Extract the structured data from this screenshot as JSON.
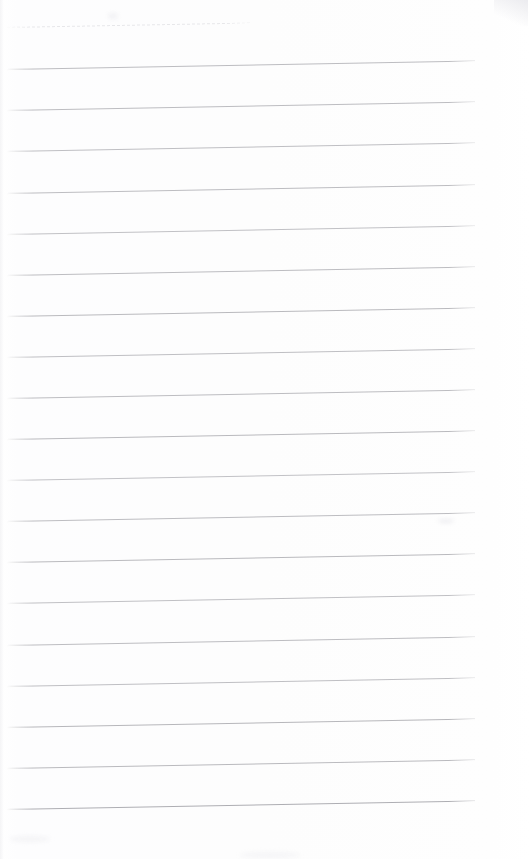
{
  "document": {
    "kind": "scanned-ruled-paper",
    "page_label": "",
    "written_text": "",
    "background_color": "#fdfdfd",
    "rule_color": "#b9b9bd",
    "rule_color_faint": "#cfcfd4",
    "rule_color_dark": "#aeaeb3",
    "page_width": 530,
    "page_height": 859,
    "rule_count": 20,
    "rule_spacing": 40,
    "skew_degrees": -1.05,
    "margin": {
      "left": 7,
      "right": 55,
      "top": 27,
      "bottom": 47
    },
    "rules": [
      {
        "name": "guide-line-dashed",
        "y": 27,
        "x": 7,
        "width": 243,
        "style": "dashed",
        "color": "#d2d2d7"
      },
      {
        "name": "rule-1",
        "y": 69,
        "x": 7,
        "width": 468,
        "style": "solid",
        "color": "#bdbdc1"
      },
      {
        "name": "rule-2",
        "y": 110,
        "x": 7,
        "width": 468,
        "style": "solid",
        "color": "#bdbdc1"
      },
      {
        "name": "rule-3",
        "y": 151,
        "x": 7,
        "width": 468,
        "style": "solid",
        "color": "#bfbfc3"
      },
      {
        "name": "rule-4",
        "y": 193,
        "x": 7,
        "width": 468,
        "style": "solid",
        "color": "#bdbdc1"
      },
      {
        "name": "rule-5",
        "y": 234,
        "x": 7,
        "width": 468,
        "style": "solid",
        "color": "#c1c1c5"
      },
      {
        "name": "rule-6",
        "y": 275,
        "x": 7,
        "width": 468,
        "style": "solid",
        "color": "#bdbdc1"
      },
      {
        "name": "rule-7",
        "y": 316,
        "x": 7,
        "width": 468,
        "style": "solid",
        "color": "#bababe"
      },
      {
        "name": "rule-8",
        "y": 357,
        "x": 7,
        "width": 468,
        "style": "solid",
        "color": "#bfbfc3"
      },
      {
        "name": "rule-9",
        "y": 398,
        "x": 7,
        "width": 468,
        "style": "solid",
        "color": "#bdbdc1"
      },
      {
        "name": "rule-10",
        "y": 439,
        "x": 7,
        "width": 468,
        "style": "solid",
        "color": "#bababe"
      },
      {
        "name": "rule-11",
        "y": 480,
        "x": 7,
        "width": 468,
        "style": "solid",
        "color": "#c2c2c6"
      },
      {
        "name": "rule-12",
        "y": 521,
        "x": 7,
        "width": 468,
        "style": "solid",
        "color": "#bdbdc1"
      },
      {
        "name": "rule-13",
        "y": 562,
        "x": 7,
        "width": 468,
        "style": "solid",
        "color": "#bababe"
      },
      {
        "name": "rule-14",
        "y": 603,
        "x": 7,
        "width": 468,
        "style": "solid",
        "color": "#c0c0c4"
      },
      {
        "name": "rule-15",
        "y": 645,
        "x": 7,
        "width": 468,
        "style": "solid",
        "color": "#bdbdc1"
      },
      {
        "name": "rule-16",
        "y": 686,
        "x": 7,
        "width": 468,
        "style": "solid",
        "color": "#bfbfc3"
      },
      {
        "name": "rule-17",
        "y": 727,
        "x": 7,
        "width": 468,
        "style": "solid",
        "color": "#b7b7bb"
      },
      {
        "name": "rule-18",
        "y": 768,
        "x": 7,
        "width": 468,
        "style": "solid",
        "color": "#bababe"
      },
      {
        "name": "rule-19",
        "y": 809,
        "x": 7,
        "width": 468,
        "style": "solid",
        "color": "#aeaeb3"
      }
    ],
    "artifacts": [
      {
        "name": "corner-mark-top-right",
        "x": 496,
        "y": 2,
        "width": 26,
        "height": 20,
        "color": "#e9e9ed"
      },
      {
        "name": "smudge-top-center",
        "x": 108,
        "y": 13,
        "width": 10,
        "height": 6,
        "color": "#f1f1f4"
      },
      {
        "name": "smudge-mid-right",
        "x": 438,
        "y": 519,
        "width": 16,
        "height": 4,
        "color": "#eeeef1"
      },
      {
        "name": "smudge-bottom-left",
        "x": 10,
        "y": 836,
        "width": 40,
        "height": 6,
        "color": "#f4f4f6"
      },
      {
        "name": "smudge-bottom-center",
        "x": 240,
        "y": 852,
        "width": 60,
        "height": 6,
        "color": "#f5f5f7"
      }
    ]
  }
}
